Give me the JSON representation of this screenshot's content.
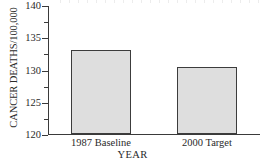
{
  "chart_data": {
    "type": "bar",
    "title": "",
    "categories": [
      "1987 Baseline",
      "2000 Target"
    ],
    "values": [
      133.0,
      130.4
    ],
    "xlabel": "YEAR",
    "ylabel": "CANCER DEATHS/100,000",
    "ylim": [
      120,
      140
    ],
    "ytick_labels": [
      "120",
      "125",
      "130",
      "135",
      "140"
    ],
    "ytick_values": [
      120,
      125,
      130,
      135,
      140
    ],
    "yminor_values": [
      122.5,
      127.5,
      132.5,
      137.5
    ],
    "grid": false,
    "legend": "none",
    "bar_fill_color": "#dedede",
    "bar_edge_color": "#3c3c3c",
    "axis_color": "#3a3a3a",
    "background_color": "#ffffff"
  },
  "axes": {
    "y_title": "CANCER DEATHS/100,000",
    "x_title": "YEAR"
  },
  "bars": [
    {
      "label": "1987 Baseline",
      "value": 133.0
    },
    {
      "label": "2000 Target",
      "value": 130.4
    }
  ]
}
